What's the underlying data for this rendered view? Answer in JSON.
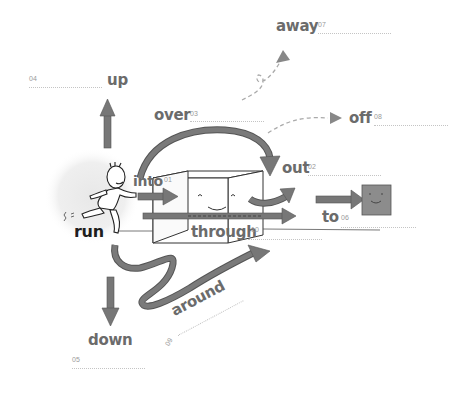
{
  "diagram": {
    "type": "prepositions-of-movement",
    "center_word": "run",
    "colors": {
      "arrow": "#777777",
      "arrow_stroke": "#555555",
      "text_gray": "#6b6b6b",
      "text_dark": "#1e1e1e",
      "number_gray": "#9a9a9a",
      "blank_line": "#c4c4c4",
      "halo": "#ededed",
      "target_square": "#8c8c8c"
    },
    "items": [
      {
        "id": "into",
        "word": "into",
        "number": "01"
      },
      {
        "id": "out",
        "word": "out",
        "number": "02"
      },
      {
        "id": "over",
        "word": "over",
        "number": "03"
      },
      {
        "id": "up",
        "word": "up",
        "number": "04"
      },
      {
        "id": "down",
        "word": "down",
        "number": "05"
      },
      {
        "id": "to",
        "word": "to",
        "number": "06"
      },
      {
        "id": "away",
        "word": "away",
        "number": "07"
      },
      {
        "id": "off",
        "word": "off",
        "number": "08"
      },
      {
        "id": "around",
        "word": "around",
        "number": "09"
      },
      {
        "id": "through",
        "word": "through",
        "number": "10"
      }
    ]
  }
}
